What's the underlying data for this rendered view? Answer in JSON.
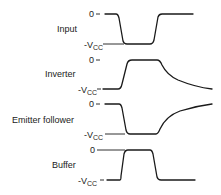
{
  "diagram": {
    "title": "",
    "level_labels": {
      "zero": "0",
      "neg_vcc_prefix": "-V",
      "neg_vcc_sub": "CC"
    },
    "traces": [
      {
        "id": "input",
        "label": "Input",
        "zero_y": 14,
        "vcc_y": 44,
        "label_y": 32,
        "path": "M105,14 L116,14 Q118,14 119,18 L123,41 Q124,44 127,44 L150,44 Q153,44 154,40 L158,17 Q159,14 162,14 L193,14"
      },
      {
        "id": "inverter",
        "label": "Inverter",
        "zero_y": 60,
        "vcc_y": 89,
        "label_y": 77,
        "path": "M103,89 L118,89 Q121,89 122,84 L127,64 Q128,60 132,60 L157,60 Q160,60 162,65 Q167,75 178,80 Q195,87 212,89"
      },
      {
        "id": "emitter-follower",
        "label": "Emitter follower",
        "zero_y": 104,
        "vcc_y": 134,
        "label_y": 123,
        "path": "M105,104 L119,104 Q121,104 122,108 L126,130 Q127,134 130,134 L156,134 Q158,134 160,129 Q166,116 180,111 Q196,106 212,104"
      },
      {
        "id": "buffer",
        "label": "Buffer",
        "zero_y": 150,
        "vcc_y": 180,
        "label_y": 168,
        "path": "M107,180 L120,180 Q121,180 121,176 L124,154 Q125,150 128,150 L150,150 Q152,150 153,154 L157,177 Q158,180 161,180 L195,180"
      }
    ]
  }
}
